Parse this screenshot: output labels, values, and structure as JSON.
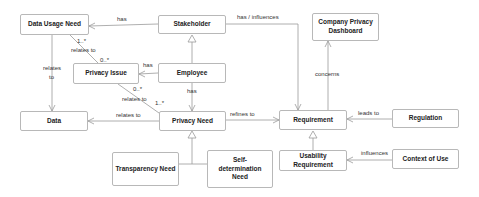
{
  "diagram": {
    "type": "UML class diagram",
    "nodes": {
      "data_usage_need": "Data Usage Need",
      "stakeholder": "Stakeholder",
      "privacy_issue": "Privacy Issue",
      "employee": "Employee",
      "data": "Data",
      "privacy_need": "Privacy Need",
      "requirement": "Requirement",
      "company_privacy_dashboard": "Company Privacy Dashboard",
      "regulation": "Regulation",
      "transparency_need": "Transparency Need",
      "self_determination_need": "Self-determination Need",
      "usability_requirement": "Usability Requirement",
      "context_of_use": "Context of Use"
    },
    "edge_labels": {
      "stakeholder_has_dun": "has",
      "stakeholder_has_influences_req": "has / influences",
      "dun_relates_to_pi": "relates to",
      "dun_mult": "1..*",
      "pi_mult_top": "0..*",
      "dun_relates_data_1": "relates",
      "dun_relates_data_2": "to",
      "employee_has_pi": "has",
      "employee_has_pn": "has",
      "pi_mult_bottom": "0..*",
      "pi_relates_to_pn": "relates to",
      "pn_mult": "1..*",
      "pn_relates_to_data": "relates to",
      "pn_refines_req": "refines to",
      "req_concerns_cpd": "concerns",
      "reg_leads_to_req": "leads to",
      "cou_influences_ur": "influences"
    },
    "edges": [
      {
        "from": "Stakeholder",
        "to": "Data Usage Need",
        "label": "has"
      },
      {
        "from": "Stakeholder",
        "to": "Requirement",
        "label": "has / influences"
      },
      {
        "from": "Data Usage Need",
        "to": "Privacy Issue",
        "label": "relates to",
        "mult_from": "1..*",
        "mult_to": "0..*"
      },
      {
        "from": "Data Usage Need",
        "to": "Data",
        "label": "relates to"
      },
      {
        "from": "Employee",
        "to": "Stakeholder",
        "type": "generalization"
      },
      {
        "from": "Employee",
        "to": "Privacy Issue",
        "label": "has"
      },
      {
        "from": "Employee",
        "to": "Privacy Need",
        "label": "has"
      },
      {
        "from": "Privacy Issue",
        "to": "Privacy Need",
        "label": "relates to",
        "mult_from": "0..*",
        "mult_to": "1..*"
      },
      {
        "from": "Privacy Need",
        "to": "Data",
        "label": "relates to"
      },
      {
        "from": "Privacy Need",
        "to": "Requirement",
        "label": "refines to"
      },
      {
        "from": "Requirement",
        "to": "Company Privacy Dashboard",
        "label": "concerns"
      },
      {
        "from": "Regulation",
        "to": "Requirement",
        "label": "leads to"
      },
      {
        "from": "Transparency Need",
        "to": "Privacy Need",
        "type": "generalization"
      },
      {
        "from": "Self-determination Need",
        "to": "Privacy Need",
        "type": "generalization"
      },
      {
        "from": "Usability Requirement",
        "to": "Requirement",
        "type": "generalization"
      },
      {
        "from": "Context of Use",
        "to": "Usability Requirement",
        "label": "influences"
      }
    ]
  }
}
